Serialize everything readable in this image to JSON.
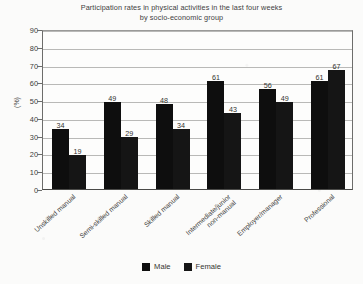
{
  "chart_data": {
    "type": "bar",
    "title": "Participation rates in physical activities in the last four weeks by socio-economic group",
    "title_line1": "Participation rates in physical activities in the last four weeks",
    "title_line2": "by socio-economic group",
    "xlabel": "",
    "ylabel": "(%)",
    "ylim": [
      0,
      90
    ],
    "ytick_values": [
      90,
      80,
      70,
      60,
      50,
      40,
      30,
      20,
      10,
      0
    ],
    "ytick_labels": [
      "90",
      "80",
      "70",
      "60",
      "50",
      "40",
      "30",
      "20",
      "10",
      "0"
    ],
    "grid": true,
    "legend_position": "bottom",
    "categories": [
      "Unskilled manual",
      "Semi-skilled manual",
      "Skilled manual",
      "Intermediate/junior non-manual",
      "Employer/manager",
      "Professional"
    ],
    "category_lines": [
      [
        "Unskilled manual",
        ""
      ],
      [
        "Semi-skilled manual",
        ""
      ],
      [
        "Skilled manual",
        ""
      ],
      [
        "Intermediate/junior",
        "non-manual"
      ],
      [
        "Employer/manager",
        ""
      ],
      [
        "Professional",
        ""
      ]
    ],
    "series": [
      {
        "name": "Male",
        "color": "#0e0e0e",
        "values": [
          34,
          49,
          48,
          61,
          56,
          61
        ]
      },
      {
        "name": "Female",
        "color": "#151515",
        "values": [
          19,
          29,
          34,
          43,
          49,
          67
        ]
      }
    ]
  },
  "legend": {
    "items": [
      {
        "label": "Male",
        "color": "#0e0e0e"
      },
      {
        "label": "Female",
        "color": "#151515"
      }
    ]
  }
}
